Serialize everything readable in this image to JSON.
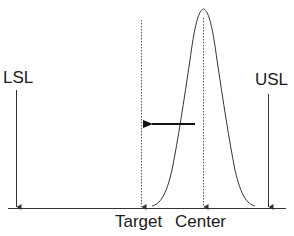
{
  "diagram": {
    "type": "process-capability-shift",
    "labels": {
      "lsl": "LSL",
      "usl": "USL",
      "target": "Target",
      "center": "Center"
    },
    "elements": {
      "baseline": "horizontal axis",
      "lsl_marker": "vertical arrow at lower specification limit",
      "usl_marker": "vertical arrow at upper specification limit",
      "target_line": "dotted vertical line at target",
      "center_line": "dotted vertical line at process center",
      "distribution": "bell-shaped normal distribution curve centered at Center",
      "shift_arrow": "horizontal arrow pointing left from Center toward Target"
    },
    "colors": {
      "line": "#333333",
      "text": "#1a1a1a",
      "background": "#ffffff"
    }
  }
}
